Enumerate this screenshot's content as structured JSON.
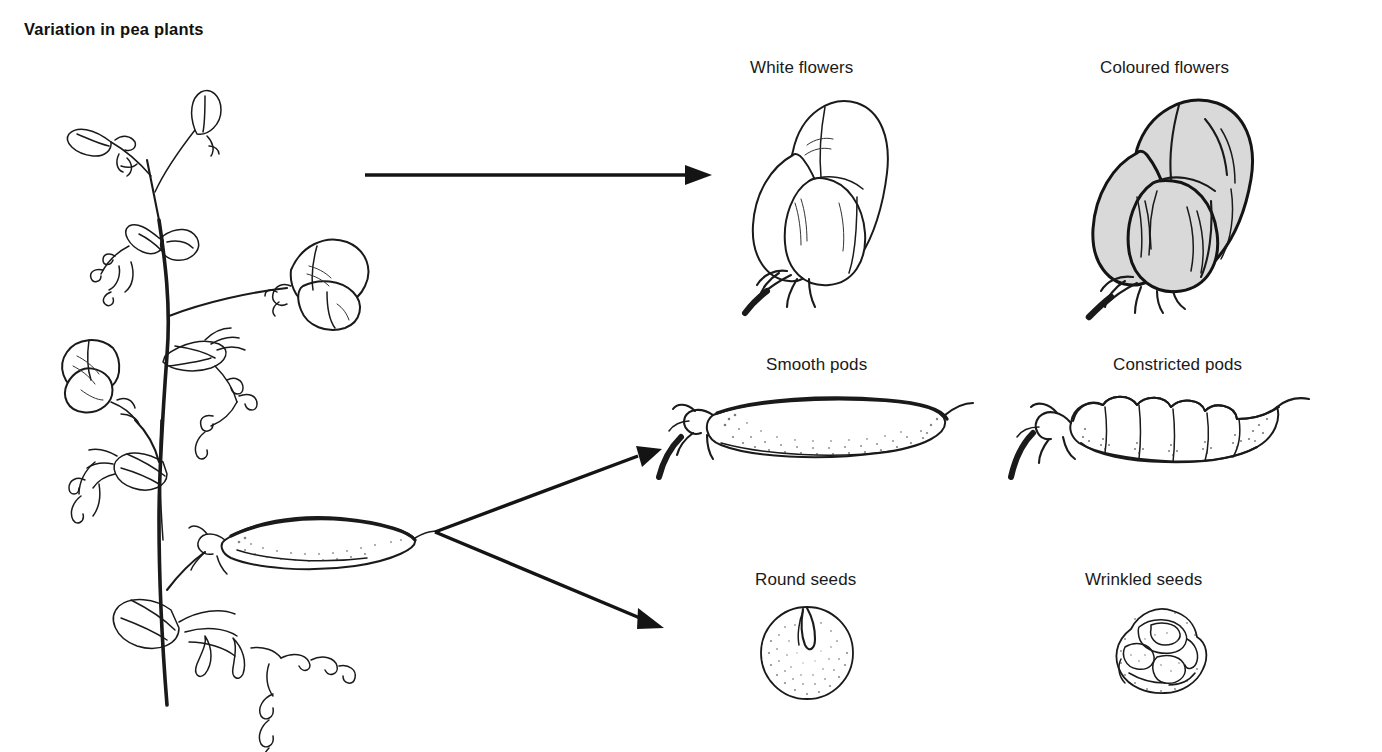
{
  "document": {
    "title": "Variation in pea plants",
    "background_color": "#ffffff",
    "ink_color": "#1a1a1a",
    "shading_color": "#d9d9d9"
  },
  "figure": {
    "source_organism_label": "pea plant",
    "traits": [
      {
        "trait": "flower colour",
        "row": 1,
        "alternatives": [
          {
            "label": "White flowers",
            "shaded": false,
            "icon": "pea-flower-white-icon"
          },
          {
            "label": "Coloured flowers",
            "shaded": true,
            "icon": "pea-flower-coloured-icon"
          }
        ]
      },
      {
        "trait": "pod shape",
        "row": 2,
        "alternatives": [
          {
            "label": "Smooth pods",
            "shaded": false,
            "icon": "pea-pod-smooth-icon"
          },
          {
            "label": "Constricted pods",
            "shaded": false,
            "icon": "pea-pod-constricted-icon"
          }
        ]
      },
      {
        "trait": "seed shape",
        "row": 3,
        "alternatives": [
          {
            "label": "Round seeds",
            "shaded": false,
            "icon": "pea-seed-round-icon"
          },
          {
            "label": "Wrinkled seeds",
            "shaded": false,
            "icon": "pea-seed-wrinkled-icon"
          }
        ]
      }
    ],
    "arrows": [
      {
        "name": "arrow-to-flowers",
        "from": "plant-flower",
        "to": "flower-row"
      },
      {
        "name": "arrow-to-pods",
        "from": "plant-pod",
        "to": "pod-row"
      },
      {
        "name": "arrow-to-seeds",
        "from": "plant-pod",
        "to": "seed-row"
      }
    ]
  },
  "labels": {
    "white_flowers": "White flowers",
    "coloured_flowers": "Coloured flowers",
    "smooth_pods": "Smooth pods",
    "constricted_pods": "Constricted pods",
    "round_seeds": "Round seeds",
    "wrinkled_seeds": "Wrinkled seeds"
  }
}
